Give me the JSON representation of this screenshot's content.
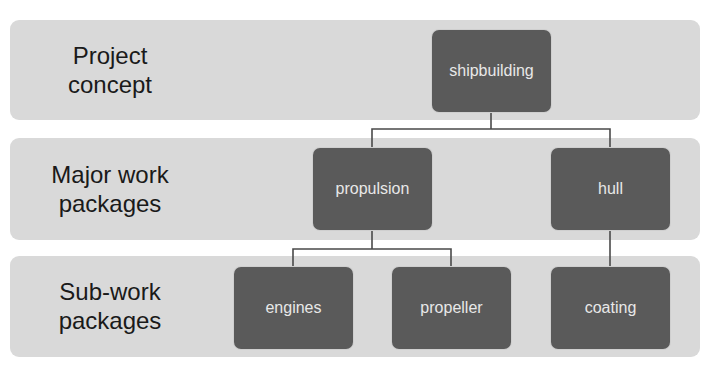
{
  "diagram": {
    "type": "work-breakdown-structure",
    "levels": [
      {
        "label_line1": "Project",
        "label_line2": "concept"
      },
      {
        "label_line1": "Major work",
        "label_line2": "packages"
      },
      {
        "label_line1": "Sub-work",
        "label_line2": "packages"
      }
    ],
    "nodes": {
      "root": "shipbuilding",
      "propulsion": "propulsion",
      "hull": "hull",
      "engines": "engines",
      "propeller": "propeller",
      "coating": "coating"
    },
    "edges": [
      [
        "shipbuilding",
        "propulsion"
      ],
      [
        "shipbuilding",
        "hull"
      ],
      [
        "propulsion",
        "engines"
      ],
      [
        "propulsion",
        "propeller"
      ],
      [
        "hull",
        "coating"
      ]
    ],
    "colors": {
      "band": "#d9d9d9",
      "node": "#5a5a5a",
      "node_text": "#e8e8e8",
      "connector": "#4a4a4a"
    }
  }
}
